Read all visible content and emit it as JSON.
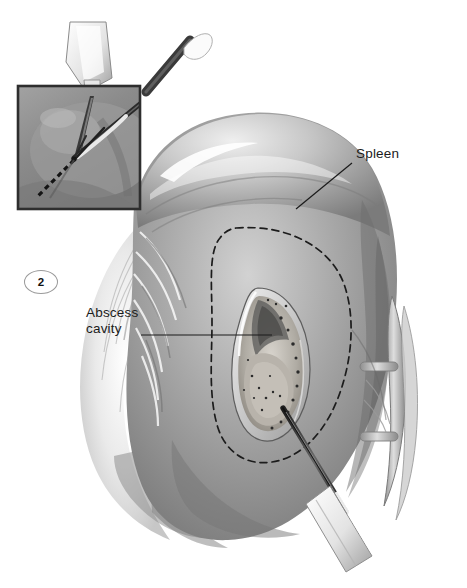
{
  "figure": {
    "number": "2",
    "domain_note": "surgical illustration",
    "background_color": "#ffffff",
    "ink_color": "#1b1b1b"
  },
  "labels": [
    {
      "name": "spleen",
      "text": "Spleen",
      "x": 356,
      "y": 146,
      "leader": {
        "x1": 352,
        "y1": 163,
        "x2": 296,
        "y2": 209
      }
    },
    {
      "name": "abscess-cavity",
      "line1": "Abscess",
      "line2": "cavity",
      "x": 86,
      "y": 305,
      "leader": {
        "x1": 141,
        "y1": 335,
        "x2": 272,
        "y2": 335
      }
    }
  ],
  "inset": {
    "name": "laparoscopic-incision-inset",
    "x": 18,
    "y": 86,
    "width": 122,
    "height": 123,
    "border_color": "#2e2e2e",
    "field_color": "#8e8e8e",
    "instruments": [
      {
        "name": "electrocautery-probe",
        "style": "light-shaft-vertical"
      },
      {
        "name": "grasper-forceps",
        "style": "dark-shaft-angled"
      }
    ],
    "incision_line_style": "dashed"
  },
  "anatomy": {
    "organ": "spleen",
    "capsule_highlight": true,
    "resection_outline_style": "dashed",
    "cavity": {
      "name": "abscess-cavity",
      "texture": "granular-speckled"
    },
    "vessels": {
      "name": "splenic-hilar-vessels",
      "position": "right-margin"
    },
    "omentum": {
      "name": "omental-fat",
      "position": "lower-left"
    }
  },
  "instrument_main": {
    "name": "suction-aspirator",
    "entry": "bottom-right",
    "tip_target": "abscess-cavity"
  }
}
